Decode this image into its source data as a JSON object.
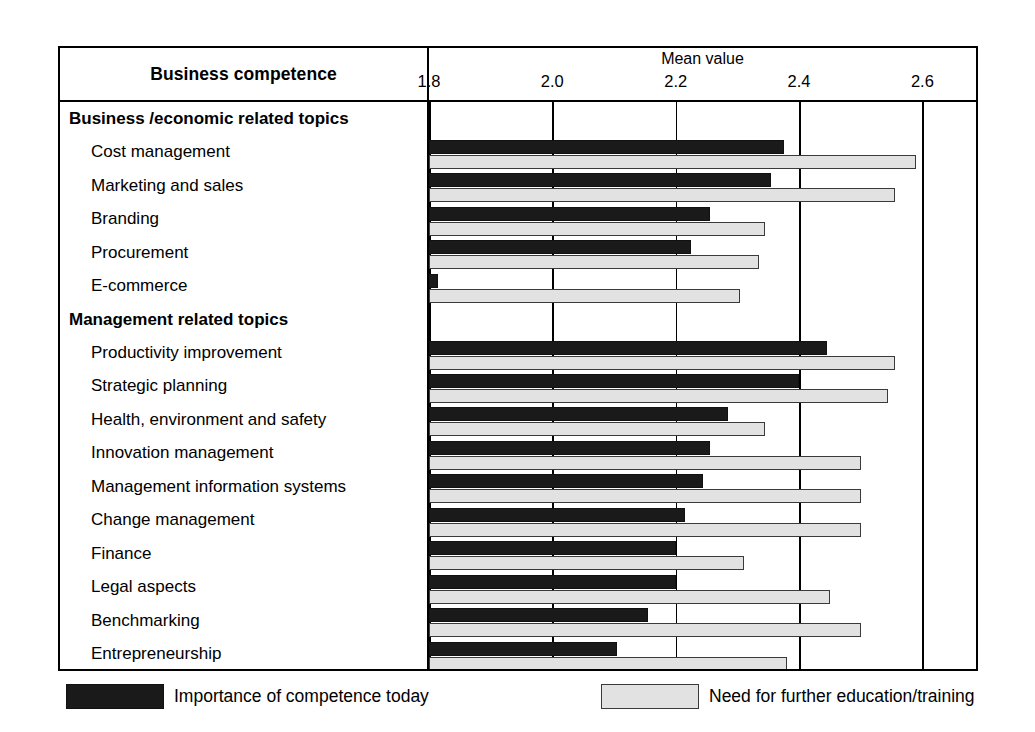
{
  "header": {
    "left_title": "Business competence",
    "axis_title": "Mean value"
  },
  "legend": {
    "series1_label": "Importance of competence today",
    "series2_label": "Need for further education/training",
    "series1_color": "#1a1a1a",
    "series2_color": "#e2e2e2"
  },
  "chart_data": {
    "type": "bar",
    "orientation": "horizontal",
    "title": "Business competence",
    "xlabel": "Mean value",
    "ylabel": "Business competence",
    "xlim": [
      1.8,
      2.687
    ],
    "xticks": [
      1.8,
      2.0,
      2.2,
      2.4,
      2.6
    ],
    "xtick_labels": [
      "1.8",
      "2.0",
      "2.2",
      "2.4",
      "2.6"
    ],
    "grid": true,
    "legend_position": "bottom",
    "series": [
      {
        "name": "Importance of competence today",
        "color": "#1a1a1a",
        "values": [
          2.375,
          2.355,
          2.255,
          2.225,
          1.815,
          2.445,
          2.4,
          2.285,
          2.255,
          2.245,
          2.215,
          2.2,
          2.2,
          2.155,
          2.105
        ]
      },
      {
        "name": "Need for further education/training",
        "color": "#e2e2e2",
        "values": [
          2.59,
          2.555,
          2.345,
          2.335,
          2.305,
          2.555,
          2.545,
          2.345,
          2.5,
          2.5,
          2.5,
          2.31,
          2.45,
          2.5,
          2.38
        ]
      }
    ],
    "groups": [
      {
        "label": "Business /economic  related topics",
        "categories": [
          "Cost management",
          "Marketing and sales",
          "Branding",
          "Procurement",
          "E-commerce"
        ]
      },
      {
        "label": "Management  related topics",
        "categories": [
          "Productivity improvement",
          "Strategic planning",
          "Health, environment and safety",
          "Innovation management",
          "Management information systems",
          "Change management",
          "Finance",
          "Legal aspects",
          "Benchmarking",
          "Entrepreneurship"
        ]
      }
    ],
    "categories": [
      "Cost management",
      "Marketing and sales",
      "Branding",
      "Procurement",
      "E-commerce",
      "Productivity improvement",
      "Strategic planning",
      "Health, environment and safety",
      "Innovation management",
      "Management information systems",
      "Change management",
      "Finance",
      "Legal aspects",
      "Benchmarking",
      "Entrepreneurship"
    ]
  },
  "rows": [
    {
      "label": "Business /economic  related topics",
      "type": "group"
    },
    {
      "label": "Cost management",
      "type": "item",
      "v1": 2.375,
      "v2": 2.59
    },
    {
      "label": "Marketing and sales",
      "type": "item",
      "v1": 2.355,
      "v2": 2.555
    },
    {
      "label": "Branding",
      "type": "item",
      "v1": 2.255,
      "v2": 2.345
    },
    {
      "label": "Procurement",
      "type": "item",
      "v1": 2.225,
      "v2": 2.335
    },
    {
      "label": "E-commerce",
      "type": "item",
      "v1": 1.815,
      "v2": 2.305
    },
    {
      "label": "Management  related topics",
      "type": "group"
    },
    {
      "label": "Productivity improvement",
      "type": "item",
      "v1": 2.445,
      "v2": 2.555
    },
    {
      "label": "Strategic planning",
      "type": "item",
      "v1": 2.4,
      "v2": 2.545
    },
    {
      "label": "Health, environment and safety",
      "type": "item",
      "v1": 2.285,
      "v2": 2.345
    },
    {
      "label": "Innovation management",
      "type": "item",
      "v1": 2.255,
      "v2": 2.5
    },
    {
      "label": "Management information systems",
      "type": "item",
      "v1": 2.245,
      "v2": 2.5
    },
    {
      "label": "Change management",
      "type": "item",
      "v1": 2.215,
      "v2": 2.5
    },
    {
      "label": "Finance",
      "type": "item",
      "v1": 2.2,
      "v2": 2.31
    },
    {
      "label": "Legal aspects",
      "type": "item",
      "v1": 2.2,
      "v2": 2.45
    },
    {
      "label": "Benchmarking",
      "type": "item",
      "v1": 2.155,
      "v2": 2.5
    },
    {
      "label": "Entrepreneurship",
      "type": "item",
      "v1": 2.105,
      "v2": 2.38
    }
  ]
}
